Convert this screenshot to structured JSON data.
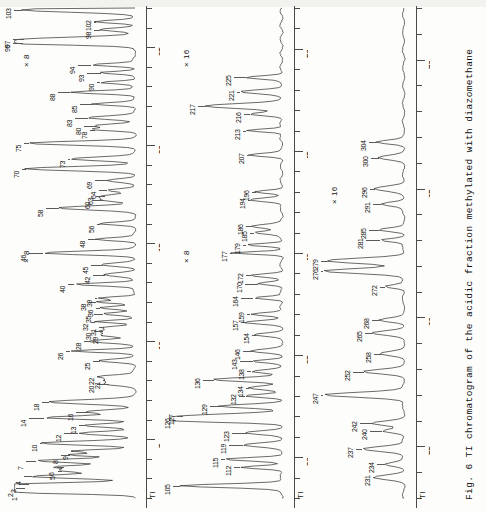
{
  "figure": {
    "caption": "Fig. 6  TI chromatogram of the acidic fraction methylated with diazomethane",
    "signal_label": "TI",
    "panel_count": 3
  },
  "chart_data": {
    "type": "line",
    "title": "TI chromatogram of the acidic fraction methylated with diazomethane",
    "xlabel": "Retention time (min)",
    "ylabel": "TI",
    "grid": false,
    "legend": false,
    "orientation": "vertical-panels-rotated-90",
    "panels": [
      {
        "name": "panel-1",
        "xlim": [
          2,
          27
        ],
        "ticks": [
          5,
          10,
          15,
          20,
          25
        ],
        "scale_annotations": [
          "× 8",
          "× 8"
        ],
        "axis_name": "TI",
        "peaks": [
          {
            "id": "1",
            "t": 2.3,
            "h": 0.97
          },
          {
            "id": "2",
            "t": 2.5,
            "h": 0.93
          },
          {
            "id": "3",
            "t": 2.7,
            "h": 0.9
          },
          {
            "id": "4",
            "t": 3.1,
            "h": 0.87
          },
          {
            "id": "5",
            "t": 3.4,
            "h": 0.62
          },
          {
            "id": "6",
            "t": 3.6,
            "h": 0.6
          },
          {
            "id": "7",
            "t": 3.9,
            "h": 0.84
          },
          {
            "id": "8",
            "t": 4.2,
            "h": 0.55
          },
          {
            "id": "9",
            "t": 4.4,
            "h": 0.52
          },
          {
            "id": "10",
            "t": 4.8,
            "h": 0.8
          },
          {
            "id": "12",
            "t": 5.3,
            "h": 0.48
          },
          {
            "id": "13",
            "t": 5.7,
            "h": 0.42
          },
          {
            "id": "14",
            "t": 6.1,
            "h": 0.77
          },
          {
            "id": "16",
            "t": 6.4,
            "h": 0.4
          },
          {
            "id": "18",
            "t": 6.9,
            "h": 0.73
          },
          {
            "id": "20",
            "t": 7.8,
            "h": 0.22
          },
          {
            "id": "21",
            "t": 8.0,
            "h": 0.25
          },
          {
            "id": "22",
            "t": 8.2,
            "h": 0.3
          },
          {
            "id": "25",
            "t": 9.0,
            "h": 0.3
          },
          {
            "id": "26",
            "t": 9.5,
            "h": 0.55
          },
          {
            "id": "28",
            "t": 10.0,
            "h": 0.4
          },
          {
            "id": "29",
            "t": 10.3,
            "h": 0.28
          },
          {
            "id": "30",
            "t": 10.5,
            "h": 0.27
          },
          {
            "id": "31",
            "t": 10.7,
            "h": 0.26
          },
          {
            "id": "32",
            "t": 11.0,
            "h": 0.34
          },
          {
            "id": "35",
            "t": 11.4,
            "h": 0.27
          },
          {
            "id": "36",
            "t": 11.7,
            "h": 0.3
          },
          {
            "id": "38",
            "t": 12.0,
            "h": 0.33
          },
          {
            "id": "39",
            "t": 12.2,
            "h": 0.32
          },
          {
            "id": "40",
            "t": 12.9,
            "h": 0.52
          },
          {
            "id": "42",
            "t": 13.4,
            "h": 0.25
          },
          {
            "id": "45",
            "t": 13.9,
            "h": 0.28
          },
          {
            "id": "46",
            "t": 14.5,
            "h": 0.78
          },
          {
            "id": "48",
            "t": 15.2,
            "h": 0.33
          },
          {
            "id": "56",
            "t": 16.0,
            "h": 0.3
          },
          {
            "id": "58",
            "t": 16.8,
            "h": 0.64
          },
          {
            "id": "60",
            "t": 17.2,
            "h": 0.26
          },
          {
            "id": "63",
            "t": 17.4,
            "h": 0.25
          },
          {
            "id": "64",
            "t": 17.7,
            "h": 0.24
          },
          {
            "id": "69",
            "t": 18.2,
            "h": 0.22
          },
          {
            "id": "70",
            "t": 18.8,
            "h": 0.92
          },
          {
            "id": "73",
            "t": 19.3,
            "h": 0.55
          },
          {
            "id": "75",
            "t": 20.1,
            "h": 0.9
          },
          {
            "id": "78",
            "t": 20.8,
            "h": 0.34
          },
          {
            "id": "80",
            "t": 21.0,
            "h": 0.33
          },
          {
            "id": "83",
            "t": 21.4,
            "h": 0.4
          },
          {
            "id": "85",
            "t": 22.1,
            "h": 0.36
          },
          {
            "id": "88",
            "t": 22.7,
            "h": 0.55
          },
          {
            "id": "90",
            "t": 23.2,
            "h": 0.3
          },
          {
            "id": "93",
            "t": 23.7,
            "h": 0.29
          },
          {
            "id": "94",
            "t": 24.1,
            "h": 0.37
          },
          {
            "id": "96",
            "t": 25.2,
            "h": 0.95
          },
          {
            "id": "97",
            "t": 25.4,
            "h": 0.94
          },
          {
            "id": "98",
            "t": 25.9,
            "h": 0.3
          },
          {
            "id": "102",
            "t": 26.3,
            "h": 0.33
          },
          {
            "id": "103",
            "t": 26.9,
            "h": 0.96
          }
        ]
      },
      {
        "name": "panel-2",
        "xlim": [
          28,
          52
        ],
        "ticks": [
          30,
          35,
          40,
          45,
          50
        ],
        "scale_annotations": [
          "× 8",
          "× 16"
        ],
        "axis_name": "TI",
        "peaks": [
          {
            "id": "105",
            "t": 28.6,
            "h": 0.93
          },
          {
            "id": "112",
            "t": 29.5,
            "h": 0.38
          },
          {
            "id": "115",
            "t": 29.9,
            "h": 0.52
          },
          {
            "id": "119",
            "t": 30.6,
            "h": 0.35
          },
          {
            "id": "123",
            "t": 31.2,
            "h": 0.32
          },
          {
            "id": "126",
            "t": 31.8,
            "h": 0.96
          },
          {
            "id": "127",
            "t": 32.0,
            "h": 0.9
          },
          {
            "id": "129",
            "t": 32.5,
            "h": 0.56
          },
          {
            "id": "132",
            "t": 33.0,
            "h": 0.34
          },
          {
            "id": "134",
            "t": 33.4,
            "h": 0.3
          },
          {
            "id": "136",
            "t": 33.8,
            "h": 0.62
          },
          {
            "id": "138",
            "t": 34.2,
            "h": 0.28
          },
          {
            "id": "143",
            "t": 34.7,
            "h": 0.26
          },
          {
            "id": "146",
            "t": 35.2,
            "h": 0.27
          },
          {
            "id": "154",
            "t": 36.0,
            "h": 0.24
          },
          {
            "id": "157",
            "t": 36.6,
            "h": 0.33
          },
          {
            "id": "159",
            "t": 37.0,
            "h": 0.29
          },
          {
            "id": "164",
            "t": 37.8,
            "h": 0.26
          },
          {
            "id": "170",
            "t": 38.5,
            "h": 0.22
          },
          {
            "id": "172",
            "t": 38.9,
            "h": 0.28
          },
          {
            "id": "177",
            "t": 40.0,
            "h": 0.45
          },
          {
            "id": "179",
            "t": 40.4,
            "h": 0.33
          },
          {
            "id": "185",
            "t": 41.0,
            "h": 0.25
          },
          {
            "id": "186",
            "t": 41.3,
            "h": 0.27
          },
          {
            "id": "194",
            "t": 42.6,
            "h": 0.3
          },
          {
            "id": "196",
            "t": 43.0,
            "h": 0.24
          },
          {
            "id": "207",
            "t": 44.8,
            "h": 0.3
          },
          {
            "id": "213",
            "t": 46.0,
            "h": 0.33
          },
          {
            "id": "216",
            "t": 46.8,
            "h": 0.29
          },
          {
            "id": "217",
            "t": 47.2,
            "h": 0.7
          },
          {
            "id": "221",
            "t": 47.9,
            "h": 0.38
          },
          {
            "id": "225",
            "t": 48.6,
            "h": 0.33
          }
        ]
      },
      {
        "name": "panel-3",
        "xlim": [
          53,
          72
        ],
        "ticks": [
          55,
          60,
          65,
          70
        ],
        "scale_annotations": [
          "× 16"
        ],
        "axis_name": "TI",
        "peaks": [
          {
            "id": "231",
            "t": 53.8,
            "h": 0.33
          },
          {
            "id": "234",
            "t": 54.3,
            "h": 0.22
          },
          {
            "id": "237",
            "t": 54.9,
            "h": 0.48
          },
          {
            "id": "240",
            "t": 55.6,
            "h": 0.25
          },
          {
            "id": "242",
            "t": 55.9,
            "h": 0.36
          },
          {
            "id": "247",
            "t": 57.0,
            "h": 0.92
          },
          {
            "id": "252",
            "t": 57.9,
            "h": 0.45
          },
          {
            "id": "258",
            "t": 58.6,
            "h": 0.26
          },
          {
            "id": "265",
            "t": 59.4,
            "h": 0.35
          },
          {
            "id": "268",
            "t": 59.9,
            "h": 0.28
          },
          {
            "id": "272",
            "t": 61.2,
            "h": 0.22
          },
          {
            "id": "276",
            "t": 61.8,
            "h": 0.93
          },
          {
            "id": "279",
            "t": 62.2,
            "h": 0.88
          },
          {
            "id": "281",
            "t": 63.0,
            "h": 0.27
          },
          {
            "id": "285",
            "t": 63.4,
            "h": 0.28
          },
          {
            "id": "291",
            "t": 64.4,
            "h": 0.26
          },
          {
            "id": "296",
            "t": 65.0,
            "h": 0.33
          },
          {
            "id": "300",
            "t": 66.2,
            "h": 0.28
          },
          {
            "id": "304",
            "t": 66.8,
            "h": 0.31
          }
        ]
      }
    ]
  }
}
